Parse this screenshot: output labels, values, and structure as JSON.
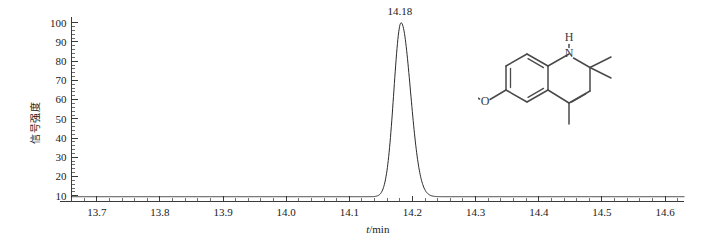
{
  "chart_data": {
    "type": "line",
    "title": "",
    "subtitle": "",
    "xlabel": "t/min",
    "xlabel_italic_part": "t",
    "xlabel_rest": "/min",
    "ylabel": "信号强度",
    "xlim": [
      13.66,
      14.63
    ],
    "ylim": [
      7,
      103
    ],
    "grid": false,
    "legend": "none",
    "x_ticks": [
      "13.7",
      "13.8",
      "13.9",
      "14.0",
      "14.1",
      "14.2",
      "14.3",
      "14.4",
      "14.5",
      "14.6"
    ],
    "x_tick_values": [
      13.7,
      13.8,
      13.9,
      14.0,
      14.1,
      14.2,
      14.3,
      14.4,
      14.5,
      14.6
    ],
    "x_minor_per_major": 5,
    "y_ticks": [
      "10",
      "20",
      "30",
      "40",
      "50",
      "60",
      "70",
      "80",
      "90",
      "100"
    ],
    "y_tick_values": [
      10,
      20,
      30,
      40,
      50,
      60,
      70,
      80,
      90,
      100
    ],
    "y_minor_per_major": 5,
    "annotations": [
      {
        "name": "peak-retention-time",
        "text": "14.18",
        "x": 14.18,
        "y": 100
      }
    ],
    "series": [
      {
        "name": "chromatogram-trace",
        "color": "#2b2b2b",
        "baseline": 9.5,
        "peaks": [
          {
            "center": 14.182,
            "height": 90.5,
            "sigma": 0.0115,
            "tail": 0.012
          }
        ],
        "x": [
          13.66,
          13.7,
          13.75,
          13.8,
          13.85,
          13.9,
          13.95,
          14.0,
          14.05,
          14.08,
          14.1,
          14.12,
          14.13,
          14.14,
          14.145,
          14.15,
          14.155,
          14.16,
          14.165,
          14.17,
          14.175,
          14.18,
          14.182,
          14.185,
          14.19,
          14.195,
          14.2,
          14.205,
          14.21,
          14.215,
          14.22,
          14.23,
          14.24,
          14.25,
          14.27,
          14.3,
          14.35,
          14.4,
          14.45,
          14.5,
          14.55,
          14.6,
          14.63
        ],
        "y": [
          9.5,
          9.5,
          9.5,
          9.5,
          9.5,
          9.5,
          9.5,
          9.5,
          9.5,
          9.5,
          9.6,
          9.8,
          10.2,
          11.6,
          13.5,
          17.5,
          25.0,
          38.0,
          55.0,
          72.0,
          88.0,
          98.0,
          100.0,
          99.0,
          93.0,
          82.0,
          66.0,
          49.0,
          34.0,
          23.0,
          16.5,
          11.5,
          10.2,
          9.8,
          9.6,
          9.5,
          9.5,
          9.5,
          9.5,
          9.5,
          9.5,
          9.5,
          9.5
        ]
      }
    ]
  },
  "inset": {
    "name": "chemical-structure-ethoxyquin",
    "compound": "ethoxyquin",
    "atom_labels": [
      {
        "name": "nitrogen-atom-label",
        "text": "N"
      },
      {
        "name": "hydrogen-atom-label",
        "text": "H"
      },
      {
        "name": "oxygen-atom-label",
        "text": "O"
      }
    ]
  }
}
